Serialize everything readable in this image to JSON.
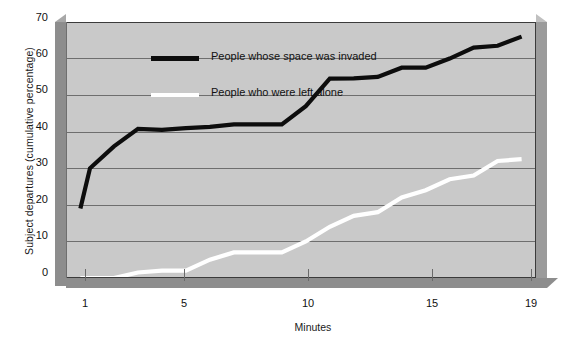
{
  "chart_data": {
    "type": "line",
    "title": "",
    "subtitle": "",
    "xlabel": "Minutes",
    "ylabel": "Subject departures (cumulative percentage)",
    "xlim": [
      0,
      19.6
    ],
    "ylim": [
      0,
      70
    ],
    "xticks": [
      1,
      5,
      10,
      15,
      19
    ],
    "xtick_labels": [
      "1",
      "5",
      "10",
      "15",
      "19"
    ],
    "yticks": [
      0,
      10,
      20,
      30,
      40,
      50,
      60,
      70
    ],
    "ytick_labels": [
      "0",
      "10",
      "20",
      "30",
      "40",
      "50",
      "60",
      "70"
    ],
    "grid": true,
    "grid_axis": "y",
    "legend_position": "upper-left-inside",
    "series": [
      {
        "name": "People whose space was invaded",
        "color": "#0d0d0d",
        "x": [
          0.6,
          1,
          2,
          3,
          4,
          5,
          6,
          7,
          8,
          9,
          10,
          11,
          12,
          13,
          14,
          15,
          16,
          17,
          18,
          19
        ],
        "values": [
          19,
          30,
          36,
          40.8,
          40.5,
          41,
          41.3,
          42,
          42,
          42,
          47,
          54.5,
          54.6,
          55,
          57.5,
          57.5,
          60,
          63,
          63.5,
          66
        ]
      },
      {
        "name": "People who were left alone",
        "color": "#ffffff",
        "x": [
          0.6,
          1,
          2,
          3,
          4,
          5,
          6,
          7,
          8,
          9,
          10,
          11,
          12,
          13,
          14,
          15,
          16,
          17,
          18,
          19
        ],
        "values": [
          0,
          0,
          0,
          1.5,
          2,
          2,
          5,
          7,
          7,
          7,
          10,
          14,
          17,
          18,
          22,
          24,
          27,
          28,
          32,
          32.5
        ]
      }
    ]
  },
  "axes": {
    "ylabel": "Subject departures (cumulative percentage)",
    "xlabel": "Minutes",
    "ytick_labels": [
      "70",
      "60",
      "50",
      "40",
      "30",
      "20",
      "10",
      "0"
    ],
    "xtick_labels": [
      "1",
      "5",
      "10",
      "15",
      "19"
    ]
  },
  "legend": {
    "items": [
      {
        "label": "People whose space was invaded",
        "color": "#0d0d0d"
      },
      {
        "label": "People who were left alone",
        "color": "#ffffff"
      }
    ]
  },
  "colors": {
    "plot_background": "#c9c9c9",
    "page_background": "#ffffff",
    "gridline": "#6e6e6e",
    "frame_shadow": "#8d8d8d",
    "series_invaded": "#0d0d0d",
    "series_alone": "#ffffff"
  }
}
